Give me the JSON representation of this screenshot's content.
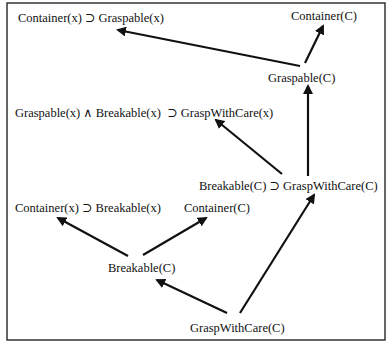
{
  "diagram": {
    "type": "directed-graph",
    "frame": {
      "x": 7,
      "y": 3,
      "width": 378,
      "height": 337
    },
    "nodes": [
      {
        "id": "n1",
        "label": "Container(x) ⊃ Graspable(x)",
        "x": 18,
        "y": 22
      },
      {
        "id": "n2",
        "label": "Container(C)",
        "x": 291,
        "y": 20
      },
      {
        "id": "n3",
        "label": "Graspable(C)",
        "x": 268,
        "y": 82
      },
      {
        "id": "n4",
        "label": "Graspable(x) ∧ Breakable(x)  ⊃ GraspWithCare(x)",
        "x": 15,
        "y": 117
      },
      {
        "id": "n5",
        "label": "Breakable(C) ⊃ GraspWithCare(C)",
        "x": 199,
        "y": 190
      },
      {
        "id": "n6",
        "label": "Container(x) ⊃ Breakable(x)",
        "x": 15,
        "y": 212
      },
      {
        "id": "n7",
        "label": "Container(C)",
        "x": 184,
        "y": 212
      },
      {
        "id": "n8",
        "label": "Breakable(C)",
        "x": 108,
        "y": 272
      },
      {
        "id": "n9",
        "label": "GraspWithCare(C)",
        "x": 190,
        "y": 332
      }
    ],
    "edges": [
      {
        "from": "n3",
        "to": "n1",
        "x1": 300,
        "y1": 66,
        "x2": 118,
        "y2": 30
      },
      {
        "from": "n3",
        "to": "n2",
        "x1": 305,
        "y1": 63,
        "x2": 323,
        "y2": 26
      },
      {
        "from": "n5",
        "to": "n3",
        "x1": 308,
        "y1": 176,
        "x2": 308,
        "y2": 86
      },
      {
        "from": "n5",
        "to": "n4",
        "x1": 282,
        "y1": 174,
        "x2": 216,
        "y2": 120
      },
      {
        "from": "n8",
        "to": "n6",
        "x1": 128,
        "y1": 256,
        "x2": 58,
        "y2": 218
      },
      {
        "from": "n8",
        "to": "n7",
        "x1": 143,
        "y1": 255,
        "x2": 206,
        "y2": 218
      },
      {
        "from": "n9",
        "to": "n8",
        "x1": 227,
        "y1": 313,
        "x2": 157,
        "y2": 280
      },
      {
        "from": "n9",
        "to": "n5",
        "x1": 240,
        "y1": 313,
        "x2": 314,
        "y2": 195
      }
    ]
  }
}
